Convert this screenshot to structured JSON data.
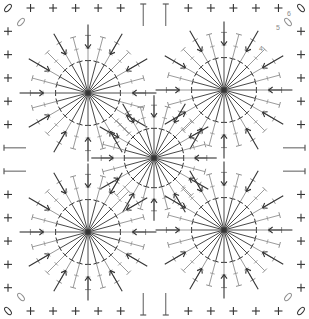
{
  "diagram": {
    "type": "crochet-chart",
    "canvas": {
      "width": 309,
      "height": 319,
      "background": "#ffffff"
    },
    "colors": {
      "dark_stitch": "#333333",
      "light_stitch": "#8f8f8f",
      "mid_stitch": "#5a5a5a",
      "label": "#8a8a8a"
    },
    "border": {
      "symbol": "single-crochet-plus",
      "top_y": 8,
      "bottom_y": 311,
      "left_x": 8,
      "right_x": 301,
      "top_count": 12,
      "side_count": 12,
      "corner_symbol": "chain-oval",
      "middle_symbol": "double-crochet-T"
    },
    "motifs": [
      {
        "name": "top-left",
        "cx": 88,
        "cy": 93,
        "spokes": 24,
        "radius": 72
      },
      {
        "name": "top-right",
        "cx": 224,
        "cy": 90,
        "spokes": 24,
        "radius": 72
      },
      {
        "name": "center",
        "cx": 154,
        "cy": 158,
        "spokes": 24,
        "radius": 66
      },
      {
        "name": "bottom-left",
        "cx": 88,
        "cy": 232,
        "spokes": 24,
        "radius": 72
      },
      {
        "name": "bottom-right",
        "cx": 224,
        "cy": 230,
        "spokes": 24,
        "radius": 72
      }
    ],
    "row_labels": [
      {
        "text": "6",
        "x": 287,
        "y": 16
      },
      {
        "text": "5",
        "x": 276,
        "y": 30
      },
      {
        "text": "4",
        "x": 259,
        "y": 51
      }
    ],
    "legend_symbols": [
      "single-crochet-plus",
      "double-crochet-T",
      "chain-oval",
      "arrow-increase"
    ]
  }
}
